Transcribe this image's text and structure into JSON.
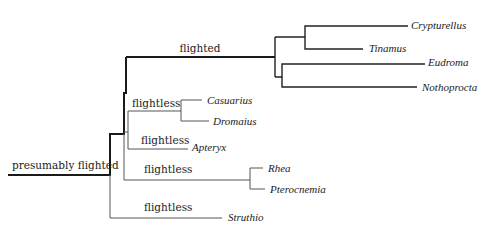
{
  "diagram": {
    "type": "phylogenetic-tree",
    "root_label": "presumably flighted",
    "branch_labels": {
      "tinamou_clade": "flighted",
      "casuarius_dromaius": "flightless",
      "apteryx": "flightless",
      "rhea_clade": "flightless",
      "struthio": "flightless"
    },
    "taxa": {
      "crypturellus": "Crypturellus",
      "tinamus": "Tinamus",
      "eudroma": "Eudroma",
      "nothoprocta": "Nothoprocta",
      "casuarius": "Casuarius",
      "dromaius": "Dromaius",
      "apteryx": "Apteryx",
      "rhea": "Rhea",
      "pterocnemia": "Pterocnemia",
      "struthio": "Struthio"
    },
    "colors": {
      "flighted_branch": "#1a1a1a",
      "flightless_branch": "#555555",
      "text": "#222222"
    }
  }
}
